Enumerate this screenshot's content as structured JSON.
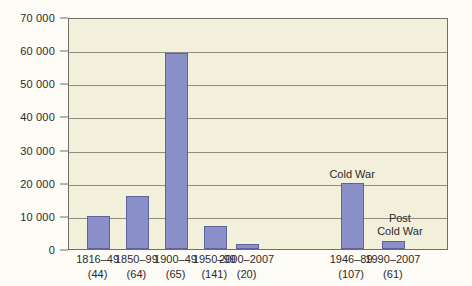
{
  "chart_data": {
    "type": "bar",
    "title": "",
    "subtitle": "",
    "xlabel": "",
    "ylabel": "",
    "ylim": [
      0,
      70000
    ],
    "grid": true,
    "legend_position": "none",
    "y_ticks": [
      {
        "value": 0,
        "label": "0"
      },
      {
        "value": 10000,
        "label": "10 000"
      },
      {
        "value": 20000,
        "label": "20 000"
      },
      {
        "value": 30000,
        "label": "30 000"
      },
      {
        "value": 40000,
        "label": "40 000"
      },
      {
        "value": 50000,
        "label": "50 000"
      },
      {
        "value": 60000,
        "label": "60 000"
      },
      {
        "value": 70000,
        "label": "70 000"
      }
    ],
    "categories": [
      "1816–49",
      "1850–99",
      "1900–49",
      "1950–99",
      "2000–2007",
      "1946–89",
      "1990–2007"
    ],
    "category_counts": [
      "(44)",
      "(64)",
      "(65)",
      "(141)",
      "(20)",
      "(107)",
      "(61)"
    ],
    "values": [
      10000,
      16000,
      59000,
      7000,
      1500,
      20000,
      2500
    ],
    "bar_color": "#8b8fc8",
    "bar_border_color": "#5f639c",
    "plot_background": "#f2f0da",
    "grid_color": "#8d8d85",
    "annotations": [
      {
        "text": "Cold War",
        "category": "1946–89"
      },
      {
        "text": "Post\nCold War",
        "category": "1990–2007"
      }
    ],
    "annotation_cold_war": "Cold War",
    "annotation_post_cold_war_line1": "Post",
    "annotation_post_cold_war_line2": "Cold War"
  }
}
